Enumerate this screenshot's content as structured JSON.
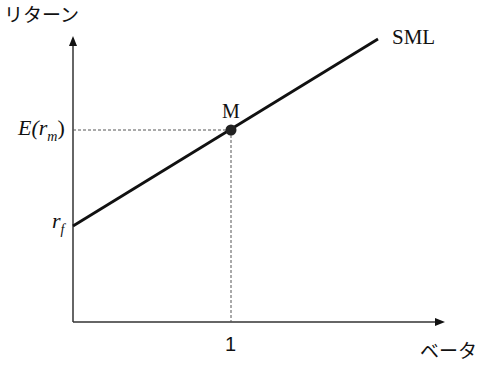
{
  "diagram": {
    "y_axis_label": "リターン",
    "x_axis_label": "ベータ",
    "line_label": "SML",
    "point_label": "M",
    "x_tick_label": "1",
    "y_labels": {
      "expected_market_return": {
        "base": "E(r",
        "sub": "m",
        "close": ")"
      },
      "risk_free": {
        "base": "r",
        "sub": "f"
      }
    },
    "colors": {
      "line": "#111111",
      "axis": "#333333",
      "guide": "#555555",
      "point": "#222222"
    }
  }
}
